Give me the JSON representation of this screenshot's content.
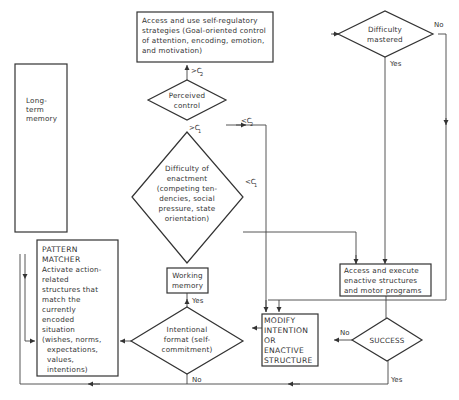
{
  "diagram": {
    "nodes": {
      "self_regulatory": {
        "lines": [
          "Access and use self-regulatory",
          "strategies (Goal-oriented control",
          "of attention, encoding, emotion,",
          "and motivation)"
        ]
      },
      "difficulty_mastered": {
        "lines": [
          "Difficulty",
          "mastered"
        ]
      },
      "long_term_memory": {
        "lines": [
          "Long-",
          "term",
          "memory"
        ]
      },
      "perceived_control": {
        "lines": [
          "Perceived",
          "control"
        ]
      },
      "difficulty_enactment": {
        "lines": [
          "Difficulty of",
          "enactment",
          "(competing ten-",
          "dencies, social",
          "pressure, state",
          "orientation)"
        ]
      },
      "pattern_matcher": {
        "lines": [
          "PATTERN",
          "MATCHER",
          "Activate action-",
          "related",
          "structures that",
          "match the",
          "currently",
          "encoded",
          "situation",
          "(wishes, norms,",
          "expectations,",
          "values,",
          "intentions)"
        ]
      },
      "working_memory": {
        "lines": [
          "Working",
          "memory"
        ]
      },
      "intentional_format": {
        "lines": [
          "Intentional",
          "format (self-",
          "commitment)"
        ]
      },
      "modify_intention": {
        "lines": [
          "MODIFY",
          "INTENTION",
          "OR",
          "ENACTIVE",
          "STRUCTURE"
        ]
      },
      "access_execute": {
        "lines": [
          "Access and execute",
          "enactive structures",
          "and motor programs"
        ]
      },
      "success": {
        "lines": [
          "SUCCESS"
        ]
      }
    },
    "edge_labels": {
      "no_mastered": "No",
      "yes_mastered": "Yes",
      "gt_c2": ">C",
      "gt_c2_sub": "2",
      "lt_c2": "<C",
      "lt_c2_sub": "2",
      "gt_c1": ">C",
      "gt_c1_sub": "1",
      "lt_c1": "<C",
      "lt_c1_sub": "1",
      "yes_intentional": "Yes",
      "no_intentional": "No",
      "no_success": "No",
      "yes_success": "Yes"
    }
  }
}
